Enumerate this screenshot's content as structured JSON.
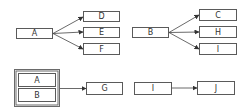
{
  "diagrams": [
    {
      "name": "fan-out-a",
      "source": "A",
      "targets": [
        "D",
        "E",
        "F"
      ]
    },
    {
      "name": "fan-out-b",
      "source": "B",
      "targets": [
        "C",
        "H",
        "I"
      ]
    },
    {
      "name": "group-to-g",
      "group": [
        "A",
        "B"
      ],
      "target": "G"
    },
    {
      "name": "i-to-j",
      "source": "I",
      "target": "J"
    }
  ],
  "colors": {
    "stroke": "#5a5a5a",
    "text": "#333333",
    "background": "#ffffff"
  }
}
